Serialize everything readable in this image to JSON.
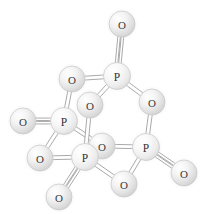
{
  "figure": {
    "background_color": "#ffffff",
    "width": 204,
    "height": 214,
    "style": "ball-and-stick",
    "atom_fill_light": "#fbfbfb",
    "atom_fill_mid": "#e6e6e6",
    "atom_fill_shadow": "#cfcfcf",
    "atom_label_color": "#3a3a3a",
    "bond_edge_color": "#9a9a9a",
    "bond_fill_color": "#ffffff"
  },
  "molecule": {
    "name": "P4O10",
    "atom_count": 14,
    "phosphorus_count": 4,
    "oxygen_count": 10,
    "atoms": [
      {
        "id": "O1",
        "element": "O",
        "label": "O",
        "x": 122,
        "y": 24,
        "r": 13.0
      },
      {
        "id": "P1",
        "element": "P",
        "label": "P",
        "x": 117,
        "y": 76,
        "r": 13.5
      },
      {
        "id": "O2",
        "element": "O",
        "label": "O",
        "x": 72,
        "y": 79,
        "r": 13.0
      },
      {
        "id": "O3",
        "element": "O",
        "label": "O",
        "x": 152,
        "y": 102,
        "r": 13.0
      },
      {
        "id": "O4",
        "element": "O",
        "label": "O",
        "x": 90,
        "y": 105,
        "r": 13.0
      },
      {
        "id": "P2",
        "element": "P",
        "label": "P",
        "x": 64,
        "y": 121,
        "r": 13.5
      },
      {
        "id": "O5",
        "element": "O",
        "label": "O",
        "x": 23,
        "y": 121,
        "r": 13.0
      },
      {
        "id": "P3",
        "element": "P",
        "label": "P",
        "x": 146,
        "y": 147,
        "r": 13.5
      },
      {
        "id": "O6",
        "element": "O",
        "label": "O",
        "x": 102,
        "y": 146,
        "r": 13.0
      },
      {
        "id": "P4",
        "element": "P",
        "label": "P",
        "x": 85,
        "y": 157,
        "r": 13.5
      },
      {
        "id": "O7",
        "element": "O",
        "label": "O",
        "x": 40,
        "y": 158,
        "r": 13.0
      },
      {
        "id": "O8",
        "element": "O",
        "label": "O",
        "x": 184,
        "y": 173,
        "r": 13.0
      },
      {
        "id": "O9",
        "element": "O",
        "label": "O",
        "x": 124,
        "y": 184,
        "r": 13.0
      },
      {
        "id": "O10",
        "element": "O",
        "label": "O",
        "x": 59,
        "y": 197,
        "r": 13.0
      }
    ],
    "bonds": [
      {
        "from": "P1",
        "to": "O1",
        "order": 2
      },
      {
        "from": "P1",
        "to": "O2",
        "order": 1
      },
      {
        "from": "P1",
        "to": "O3",
        "order": 1
      },
      {
        "from": "P1",
        "to": "O4",
        "order": 1
      },
      {
        "from": "P2",
        "to": "O2",
        "order": 1
      },
      {
        "from": "P2",
        "to": "O5",
        "order": 2
      },
      {
        "from": "P2",
        "to": "O6",
        "order": 1
      },
      {
        "from": "P2",
        "to": "O7",
        "order": 1
      },
      {
        "from": "P3",
        "to": "O3",
        "order": 1
      },
      {
        "from": "P3",
        "to": "O6",
        "order": 1
      },
      {
        "from": "P3",
        "to": "O8",
        "order": 2
      },
      {
        "from": "P3",
        "to": "O9",
        "order": 1
      },
      {
        "from": "P4",
        "to": "O4",
        "order": 1
      },
      {
        "from": "P4",
        "to": "O6",
        "order": 1
      },
      {
        "from": "P4",
        "to": "O7",
        "order": 1
      },
      {
        "from": "P4",
        "to": "O9",
        "order": 1
      },
      {
        "from": "P4",
        "to": "O10",
        "order": 2
      }
    ]
  }
}
